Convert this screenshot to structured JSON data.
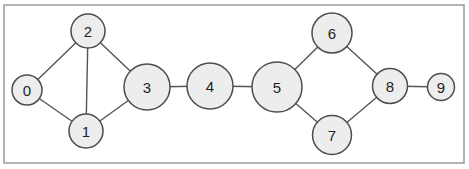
{
  "figure": {
    "width": 469,
    "height": 169,
    "background": "#ffffff"
  },
  "frame": {
    "x": 4,
    "y": 5,
    "width": 460,
    "height": 158,
    "border_color": "#999999",
    "fill": "#ffffff"
  },
  "graph": {
    "node_fill": "#ededed",
    "node_stroke": "#4d4d4d",
    "node_stroke_width": 1.5,
    "edge_color": "#555555",
    "edge_width": 1.4,
    "label_color": "#1f1f1f",
    "label_font_size": 15,
    "nodes": [
      {
        "id": "0",
        "x": 27,
        "y": 90,
        "r": 15
      },
      {
        "id": "1",
        "x": 86,
        "y": 131,
        "r": 17
      },
      {
        "id": "2",
        "x": 88,
        "y": 31,
        "r": 17
      },
      {
        "id": "3",
        "x": 147,
        "y": 87,
        "r": 23
      },
      {
        "id": "4",
        "x": 210,
        "y": 86,
        "r": 23
      },
      {
        "id": "5",
        "x": 277,
        "y": 87,
        "r": 25
      },
      {
        "id": "6",
        "x": 332,
        "y": 33,
        "r": 20
      },
      {
        "id": "7",
        "x": 332,
        "y": 135,
        "r": 19.5
      },
      {
        "id": "8",
        "x": 390,
        "y": 86,
        "r": 17.5
      },
      {
        "id": "9",
        "x": 441,
        "y": 87,
        "r": 13.5
      }
    ],
    "edges": [
      [
        "0",
        "2"
      ],
      [
        "0",
        "1"
      ],
      [
        "1",
        "2"
      ],
      [
        "2",
        "3"
      ],
      [
        "1",
        "3"
      ],
      [
        "3",
        "4"
      ],
      [
        "4",
        "5"
      ],
      [
        "5",
        "6"
      ],
      [
        "5",
        "7"
      ],
      [
        "6",
        "8"
      ],
      [
        "7",
        "8"
      ],
      [
        "8",
        "9"
      ]
    ]
  }
}
